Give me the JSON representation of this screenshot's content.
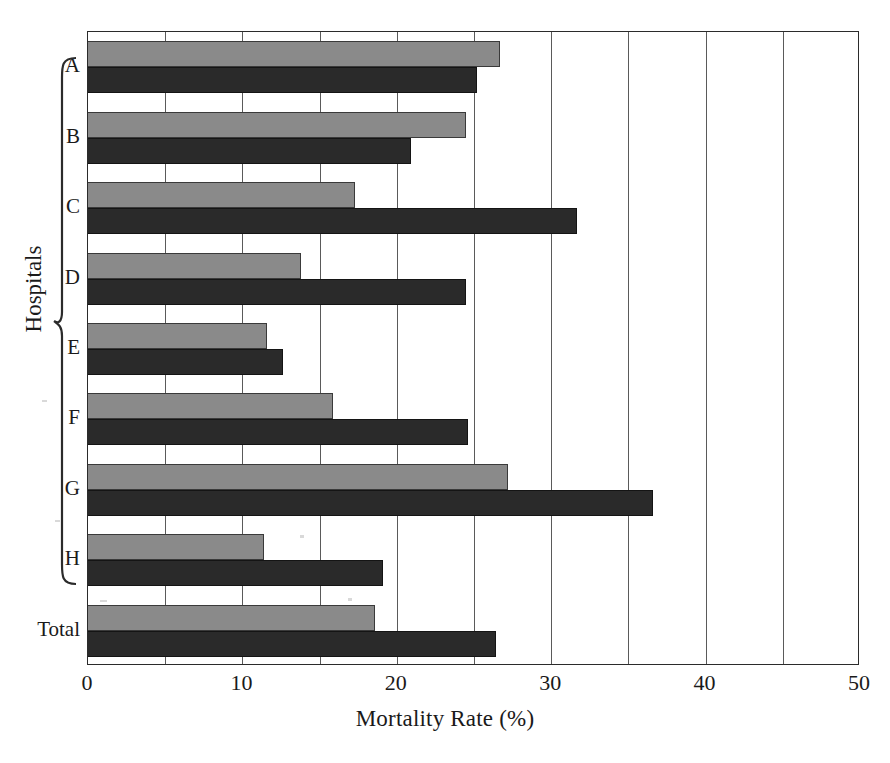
{
  "chart_data": {
    "type": "bar",
    "orientation": "horizontal",
    "title": "",
    "xlabel": "Mortality Rate (%)",
    "ylabel": "Hospitals",
    "categories": [
      "A",
      "B",
      "C",
      "D",
      "E",
      "F",
      "G",
      "H",
      "Total"
    ],
    "group_bracket_label": "Hospitals",
    "group_bracket_categories": [
      "A",
      "B",
      "C",
      "D",
      "E",
      "F",
      "G",
      "H"
    ],
    "series": [
      {
        "name": "light-grey-series",
        "color": "#8a8a8a",
        "values": [
          26.7,
          24.5,
          17.3,
          13.8,
          11.6,
          15.9,
          27.2,
          11.4,
          18.6
        ]
      },
      {
        "name": "dark-series",
        "color": "#2a2a2a",
        "values": [
          25.2,
          20.9,
          31.7,
          24.5,
          12.6,
          24.6,
          36.6,
          19.1,
          26.4
        ]
      }
    ],
    "xlim": [
      0,
      50
    ],
    "xticks": [
      0,
      10,
      20,
      30,
      40,
      50
    ],
    "xtick_labels": [
      "0",
      "10",
      "20",
      "30",
      "40",
      "50"
    ],
    "minor_gridlines": [
      5,
      15,
      25,
      35,
      45
    ],
    "grid": "vertical-only",
    "legend": "none"
  },
  "axis": {
    "x_title": "Mortality Rate (%)",
    "y_title": "Hospitals"
  }
}
